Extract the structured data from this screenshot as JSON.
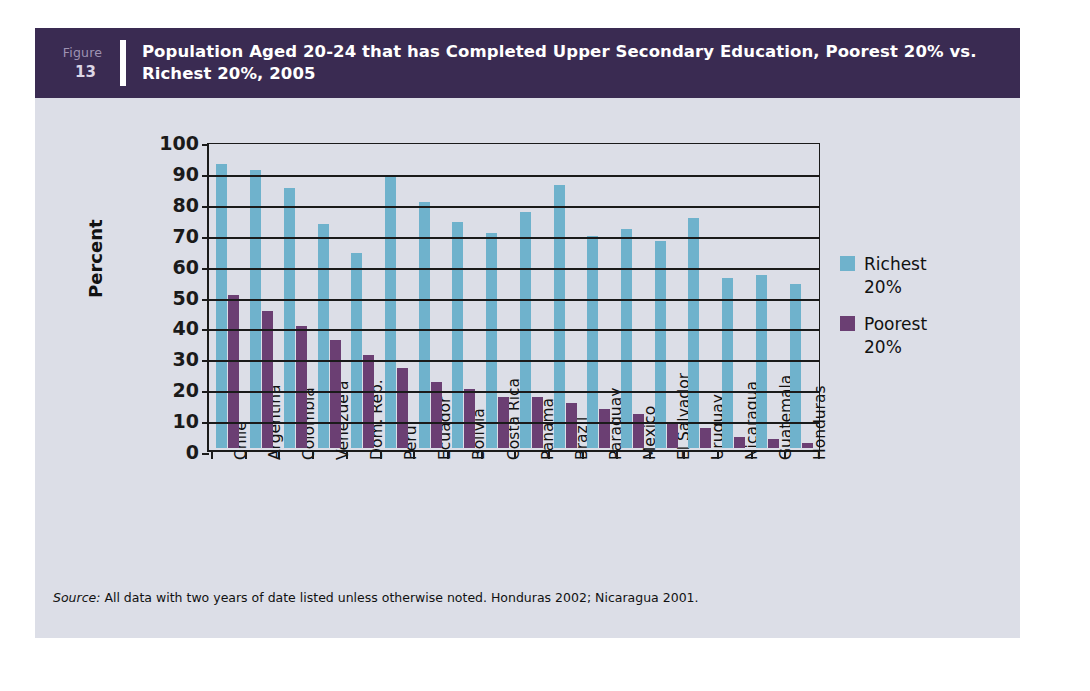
{
  "figure": {
    "label_word": "Figure",
    "number": "13",
    "title": "Population Aged 20-24 that has Completed Upper Secondary Education, Poorest 20% vs. Richest 20%, 2005"
  },
  "colors": {
    "header_bg": "#3a2b52",
    "panel_bg": "#dcdee7",
    "richest": "#6fb2cc",
    "poorest": "#6b3f73",
    "axis": "#1a1a1a"
  },
  "legend": {
    "position": "right",
    "items": [
      {
        "label": "Richest 20%",
        "color": "#6fb2cc"
      },
      {
        "label": "Poorest 20%",
        "color": "#6b3f73"
      }
    ]
  },
  "source": {
    "label": "Source:",
    "text": " All data with two years of date listed unless otherwise noted. Honduras 2002; Nicaragua 2001."
  },
  "chart_data": {
    "type": "bar",
    "title": "Population Aged 20-24 that has Completed Upper Secondary Education, Poorest 20% vs. Richest 20%, 2005",
    "xlabel": "",
    "ylabel": "Percent",
    "ylim": [
      0,
      100
    ],
    "ytick_labels": [
      "100",
      "90",
      "80",
      "70",
      "60",
      "50",
      "40",
      "30",
      "20",
      "10",
      "0"
    ],
    "yticks": [
      0,
      10,
      20,
      30,
      40,
      50,
      60,
      70,
      80,
      90,
      100
    ],
    "grid": true,
    "categories": [
      "Chile",
      "Argentina",
      "Colombia",
      "Venezuela",
      "Dom. Rep.",
      "Peru",
      "Ecuador",
      "Bolivia",
      "Costa Rica",
      "Panama",
      "Brazil",
      "Paraguay",
      "Mexico",
      "El Salvador",
      "Uruguay",
      "Nicaragua",
      "Guatemala",
      "Honduras"
    ],
    "series": [
      {
        "name": "Richest 20%",
        "color": "#6fb2cc",
        "values": [
          92,
          90,
          84,
          72.5,
          63,
          88.5,
          79.5,
          73,
          69.5,
          76.5,
          85,
          68.5,
          71,
          67,
          74.5,
          55,
          56,
          53
        ]
      },
      {
        "name": "Poorest 20%",
        "color": "#6b3f73",
        "values": [
          49.5,
          44.5,
          39.5,
          35,
          30,
          26,
          21.5,
          19,
          16.5,
          16.5,
          14.5,
          12.5,
          11,
          8.5,
          6.5,
          3.5,
          3,
          1.5
        ]
      }
    ]
  }
}
